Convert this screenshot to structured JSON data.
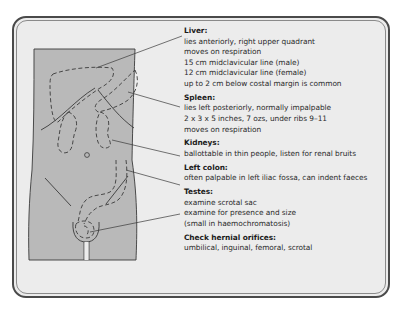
{
  "diagram": {
    "colors": {
      "frame_border": "#4a4a4a",
      "panel_background": "#ececec",
      "torso_fill": "#b9b9b9",
      "line": "#3a3a3a",
      "text": "#2a2a2a"
    },
    "sections": [
      {
        "heading": "Liver:",
        "lines": [
          "lies anteriorly, right upper quadrant",
          "moves on respiration",
          "15 cm midclavicular line (male)",
          "12 cm midclavicular line (female)",
          "up to 2 cm below costal margin is common"
        ]
      },
      {
        "heading": "Spleen:",
        "lines": [
          "lies left posteriorly, normally impalpable",
          "2 x 3 x 5 inches, 7 ozs, under ribs 9–11",
          "moves on respiration"
        ]
      },
      {
        "heading": "Kidneys:",
        "lines": [
          "ballottable in thin people, listen for renal bruits"
        ]
      },
      {
        "heading": "Left colon:",
        "lines": [
          "often palpable in left iliac fossa, can indent faeces"
        ]
      },
      {
        "heading": "Testes:",
        "lines": [
          "examine scrotal sac",
          "examine for presence and size",
          "(small in haemochromatosis)"
        ]
      },
      {
        "heading": "Check hernial orifices:",
        "lines": [
          "umbilical, inguinal, femoral, scrotal"
        ]
      }
    ]
  }
}
